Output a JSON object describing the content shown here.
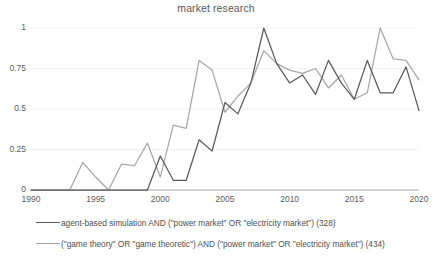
{
  "chart_data": {
    "type": "line",
    "title": "market research",
    "xlabel": "",
    "ylabel": "",
    "xlim": [
      1990,
      2020
    ],
    "ylim": [
      0,
      1
    ],
    "grid": true,
    "grid_axis": "y",
    "legend_position": "bottom",
    "x_ticks": [
      "1990",
      "1995",
      "2000",
      "2005",
      "2010",
      "2015",
      "2020"
    ],
    "x_tick_values": [
      1990,
      1995,
      2000,
      2005,
      2010,
      2015,
      2020
    ],
    "y_ticks": [
      "0",
      "0.25",
      "0.5",
      "0.75",
      "1"
    ],
    "y_tick_values": [
      0,
      0.25,
      0.5,
      0.75,
      1
    ],
    "x": [
      1990,
      1991,
      1992,
      1993,
      1994,
      1995,
      1996,
      1997,
      1998,
      1999,
      2000,
      2001,
      2002,
      2003,
      2004,
      2005,
      2006,
      2007,
      2008,
      2009,
      2010,
      2011,
      2012,
      2013,
      2014,
      2015,
      2016,
      2017,
      2018,
      2019,
      2020
    ],
    "series": [
      {
        "name": "agent-based simulation AND (\"power market\" OR \"electricity market\") (328)",
        "color": "#595959",
        "count": 328,
        "values": [
          0,
          0,
          0,
          0,
          0,
          0,
          0,
          0,
          0,
          0,
          0.21,
          0.06,
          0.06,
          0.31,
          0.24,
          0.54,
          0.47,
          0.66,
          1.0,
          0.78,
          0.66,
          0.71,
          0.59,
          0.8,
          0.66,
          0.56,
          0.8,
          0.6,
          0.6,
          0.76,
          0.49
        ]
      },
      {
        "name": "(\"game theory\" OR \"game theoretic\") AND (\"power market\" OR \"electricity market\") (434)",
        "color": "#a6a6a6",
        "count": 434,
        "values": [
          0,
          0,
          0,
          0,
          0.17,
          0.08,
          0,
          0.16,
          0.15,
          0.29,
          0.08,
          0.4,
          0.38,
          0.8,
          0.74,
          0.48,
          0.58,
          0.66,
          0.86,
          0.78,
          0.74,
          0.72,
          0.75,
          0.63,
          0.71,
          0.56,
          0.6,
          1.0,
          0.81,
          0.8,
          0.68
        ]
      }
    ]
  },
  "axis": {
    "axis_line_color": "#a6a6a6",
    "gridline_color": "#f2f2f2"
  }
}
